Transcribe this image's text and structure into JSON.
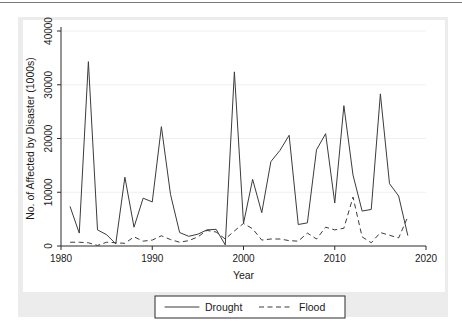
{
  "chart_data": {
    "type": "line",
    "title": "",
    "xlabel": "Year",
    "ylabel": "No. of Affected by Disaster (1000s)",
    "xlim": [
      1980,
      2020
    ],
    "ylim": [
      0,
      40000
    ],
    "xticks": [
      "1980",
      "1990",
      "2000",
      "2010",
      "2020"
    ],
    "xtick_values": [
      1980,
      1990,
      2000,
      2010,
      2020
    ],
    "yticks": [
      "0",
      "10000",
      "20000",
      "30000",
      "40000"
    ],
    "ytick_values": [
      0,
      10000,
      20000,
      30000,
      40000
    ],
    "grid": false,
    "legend_position": "below-axes",
    "x": [
      1981,
      1982,
      1983,
      1984,
      1985,
      1986,
      1987,
      1988,
      1989,
      1990,
      1991,
      1992,
      1993,
      1994,
      1995,
      1996,
      1997,
      1998,
      1999,
      2000,
      2001,
      2002,
      2003,
      2004,
      2005,
      2006,
      2007,
      2008,
      2009,
      2010,
      2011,
      2012,
      2013,
      2014,
      2015,
      2016,
      2017,
      2018
    ],
    "series": [
      {
        "name": "Drought",
        "style": "solid",
        "color": "#3b3b3b",
        "values": [
          7300,
          2400,
          34300,
          3000,
          2100,
          400,
          12800,
          3500,
          8900,
          8200,
          22200,
          9600,
          2500,
          1800,
          2200,
          3000,
          3100,
          200,
          32400,
          4200,
          12400,
          6200,
          15700,
          17800,
          20600,
          4000,
          4300,
          17900,
          20900,
          8000,
          26100,
          13200,
          6500,
          6800,
          28300,
          11600,
          9300,
          2000
        ]
      },
      {
        "name": "Flood",
        "style": "dashed",
        "color": "#3b3b3b",
        "values": [
          700,
          700,
          600,
          100,
          700,
          600,
          500,
          1700,
          900,
          1100,
          1900,
          1200,
          700,
          1000,
          1700,
          2900,
          2600,
          1300,
          2800,
          4200,
          3200,
          1100,
          1300,
          1300,
          1000,
          900,
          2400,
          1300,
          3500,
          3000,
          3300,
          9100,
          1700,
          600,
          2500,
          2000,
          1500,
          5400
        ]
      }
    ]
  },
  "legend": {
    "items": [
      {
        "label": "Drought",
        "style": "solid"
      },
      {
        "label": "Flood",
        "style": "dashed"
      }
    ]
  }
}
